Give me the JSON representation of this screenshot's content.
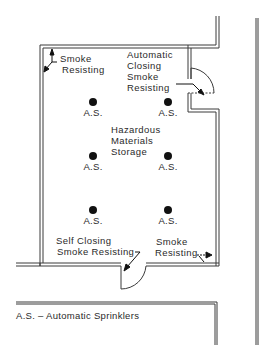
{
  "diagram": {
    "room_label": [
      "Hazardous",
      "Materials",
      "Storage"
    ],
    "annotations": {
      "top_left": [
        "Smoke",
        "Resisting"
      ],
      "top_right": [
        "Automatic",
        "Closing",
        "Smoke",
        "Resisting"
      ],
      "bottom_left": [
        "Self Closing",
        "Smoke Resisting"
      ],
      "bottom_right": [
        "Smoke",
        "Resisting"
      ]
    },
    "sprinklers": [
      {
        "label": "A.S.",
        "x": 93,
        "y": 102
      },
      {
        "label": "A.S.",
        "x": 168,
        "y": 102
      },
      {
        "label": "A.S.",
        "x": 93,
        "y": 157
      },
      {
        "label": "A.S.",
        "x": 168,
        "y": 157
      },
      {
        "label": "A.S.",
        "x": 93,
        "y": 211
      },
      {
        "label": "A.S.",
        "x": 168,
        "y": 211
      }
    ],
    "legend": "A.S. – Automatic Sprinklers",
    "colors": {
      "line": "#3a3a3a",
      "text": "#2a2a2a",
      "background": "#ffffff"
    }
  }
}
